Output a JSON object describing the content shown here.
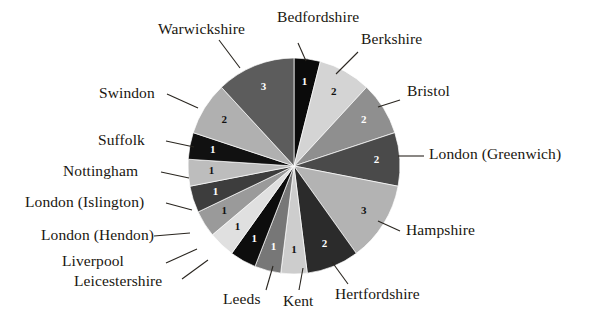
{
  "chart_data": {
    "type": "pie",
    "title": "",
    "total": 21,
    "legend_position": "callout-labels",
    "grid": false,
    "categories": [
      "Bedfordshire",
      "Berkshire",
      "Bristol",
      "London (Greenwich)",
      "Hampshire",
      "Hertfordshire",
      "Kent",
      "Leeds",
      "Leicestershire",
      "Liverpool",
      "London (Hendon)",
      "London (Islington)",
      "Nottingham",
      "Suffolk",
      "Swindon",
      "Warwickshire"
    ],
    "values": [
      1,
      2,
      2,
      2,
      3,
      2,
      1,
      1,
      1,
      1,
      1,
      1,
      1,
      1,
      2,
      3
    ],
    "colors": [
      "#0b0b0b",
      "#d4d4d4",
      "#8f8f8f",
      "#4a4a4a",
      "#b3b3b3",
      "#2b2b2b",
      "#cdcdcd",
      "#777777",
      "#0d0d0d",
      "#e0e0e0",
      "#9a9a9a",
      "#3d3d3d",
      "#bdbdbd",
      "#111111",
      "#b0b0b0",
      "#5c5c5c"
    ],
    "value_label_colors": [
      "#ffffff",
      "#111111",
      "#ffffff",
      "#ffffff",
      "#111111",
      "#ffffff",
      "#111111",
      "#ffffff",
      "#ffffff",
      "#111111",
      "#111111",
      "#ffffff",
      "#111111",
      "#ffffff",
      "#111111",
      "#ffffff"
    ]
  },
  "labels": {
    "bedfordshire": "Bedfordshire",
    "berkshire": "Berkshire",
    "bristol": "Bristol",
    "london_greenwich": "London (Greenwich)",
    "hampshire": "Hampshire",
    "hertfordshire": "Hertfordshire",
    "kent": "Kent",
    "leeds": "Leeds",
    "leicestershire": "Leicestershire",
    "liverpool": "Liverpool",
    "london_hendon": "London (Hendon)",
    "london_islington": "London (Islington)",
    "nottingham": "Nottingham",
    "suffolk": "Suffolk",
    "swindon": "Swindon",
    "warwickshire": "Warwickshire"
  },
  "values": {
    "bedfordshire": "1",
    "berkshire": "2",
    "bristol": "2",
    "london_greenwich": "2",
    "hampshire": "3",
    "hertfordshire": "2",
    "kent": "1",
    "leeds": "1",
    "leicestershire": "1",
    "liverpool": "1",
    "london_hendon": "1",
    "london_islington": "1",
    "nottingham": "1",
    "suffolk": "1",
    "swindon": "2",
    "warwickshire": "3"
  }
}
